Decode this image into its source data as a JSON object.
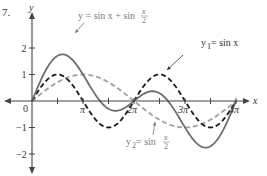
{
  "figure": {
    "number_label": "7."
  },
  "colors": {
    "axis": "#444444",
    "sum_curve": "#6e6e6e",
    "y1_curve": "#1a1a1a",
    "y2_curve": "#a0a0a0",
    "label_gray": "#7a7a7a"
  },
  "layout": {
    "origin_px": [
      32,
      101
    ],
    "px_per_pi": 51,
    "px_per_unit_y": 26.5,
    "x_axis_left": 4,
    "x_axis_right": 250,
    "y_axis_top": 12,
    "y_axis_bottom": 174
  },
  "chart_data": {
    "type": "line",
    "title": "",
    "xlabel": "x",
    "ylabel": "y",
    "xlim": [
      0,
      12.566
    ],
    "ylim": [
      -2,
      2
    ],
    "grid": false,
    "x_ticks": [
      {
        "value": 1.5708,
        "label": ""
      },
      {
        "value": 3.1416,
        "label": "π"
      },
      {
        "value": 4.7124,
        "label": ""
      },
      {
        "value": 6.2832,
        "label": "2π"
      },
      {
        "value": 7.854,
        "label": ""
      },
      {
        "value": 9.4248,
        "label": "3π"
      },
      {
        "value": 10.9956,
        "label": ""
      },
      {
        "value": 12.5664,
        "label": "4π"
      }
    ],
    "y_ticks": [
      {
        "value": 2,
        "label": "2"
      },
      {
        "value": 1,
        "label": "1"
      },
      {
        "value": -1,
        "label": "−1"
      },
      {
        "value": -2,
        "label": "−2"
      }
    ],
    "origin_label": "0",
    "series": [
      {
        "name": "y = sin x + sin(x/2)",
        "style": "solid",
        "x_multiples_of_pi": [
          0,
          0.25,
          0.5,
          0.75,
          1,
          1.25,
          1.5,
          1.75,
          2,
          2.25,
          2.5,
          2.75,
          3,
          3.25,
          3.5,
          3.75,
          4
        ],
        "values": [
          0,
          1.09,
          1.71,
          1.63,
          1.0,
          0.22,
          -0.29,
          -0.32,
          0,
          0.34,
          0.29,
          -0.24,
          -1.0,
          -1.63,
          -1.71,
          -1.09,
          0
        ]
      },
      {
        "name": "y1 = sin x",
        "style": "dashed-black",
        "x_multiples_of_pi": [
          0,
          0.5,
          1,
          1.5,
          2,
          2.5,
          3,
          3.5,
          4
        ],
        "values": [
          0,
          1,
          0,
          -1,
          0,
          1,
          0,
          -1,
          0
        ]
      },
      {
        "name": "y2 = sin(x/2)",
        "style": "dashed-gray",
        "x_multiples_of_pi": [
          0,
          0.5,
          1,
          1.5,
          2,
          2.5,
          3,
          3.5,
          4
        ],
        "values": [
          0,
          0.71,
          1,
          0.71,
          0,
          -0.71,
          -1,
          -0.71,
          0
        ]
      }
    ],
    "annotations": [
      {
        "text_main": "y = sin x + sin ",
        "frac_num": "x",
        "frac_den": "2",
        "target_series": "y = sin x + sin(x/2)"
      },
      {
        "text_main": "y",
        "sub": "1",
        "text_rest": " = sin x",
        "target_series": "y1 = sin x"
      },
      {
        "text_main": "y",
        "sub": "2",
        "text_rest": " = sin ",
        "frac_num": "x",
        "frac_den": "2",
        "target_series": "y2 = sin(x/2)"
      }
    ]
  }
}
